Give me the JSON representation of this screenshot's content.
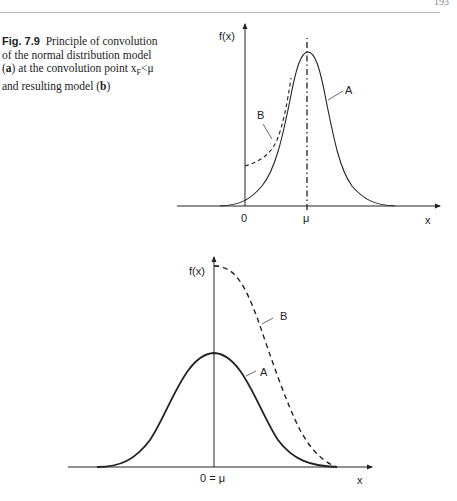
{
  "page": {
    "page_number": "193"
  },
  "caption": {
    "figure_number": "Fig. 7.9",
    "text_1": "Principle of convolution of the normal distribution model (",
    "bold_a": "a",
    "text_2": ") at the convolution point x",
    "subscript": "F",
    "text_3": "<μ and resulting model (",
    "bold_b": "b",
    "text_4": ")"
  },
  "diagram_a": {
    "y_label": "f(x)",
    "x_label": "x",
    "tick_zero": "0",
    "tick_mu": "μ",
    "curve_a_label": "A",
    "curve_b_label": "B"
  },
  "diagram_b": {
    "y_label": "f(x)",
    "x_label": "x",
    "tick_center": "0 = μ",
    "curve_a_label": "A",
    "curve_b_label": "B"
  },
  "colors": {
    "line": "#222222",
    "text": "#222222"
  }
}
